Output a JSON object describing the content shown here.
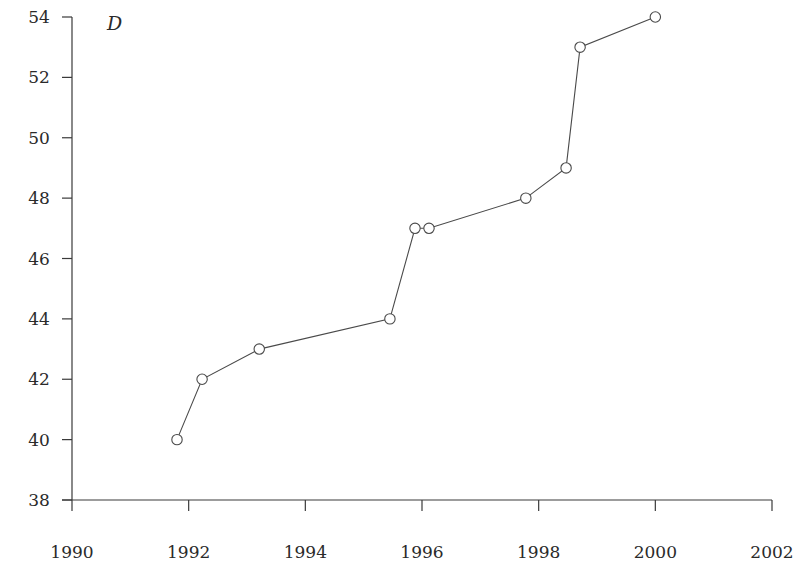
{
  "chart_data": {
    "type": "line",
    "title": "",
    "panel_label": "D",
    "xlabel": "",
    "ylabel": "",
    "xlim": [
      1990,
      2002
    ],
    "ylim": [
      38,
      54
    ],
    "x_ticks": [
      1990,
      1992,
      1994,
      1996,
      1998,
      2000,
      2002
    ],
    "y_ticks": [
      38,
      40,
      42,
      44,
      46,
      48,
      50,
      52,
      54
    ],
    "grid": false,
    "legend": null,
    "marker": "open-circle",
    "series": [
      {
        "name": "D",
        "x": [
          1991.8,
          1992.23,
          1993.21,
          1995.45,
          1995.88,
          1996.12,
          1997.78,
          1998.47,
          1998.71,
          2000.0
        ],
        "y": [
          40,
          42,
          43,
          44,
          47,
          47,
          48,
          49,
          53,
          54
        ]
      }
    ]
  },
  "caption": ""
}
